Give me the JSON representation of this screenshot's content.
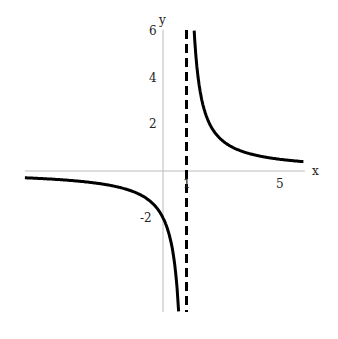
{
  "chart_data": {
    "type": "line",
    "title": "",
    "function": "y = 2/(x-1)",
    "xlabel": "x",
    "ylabel": "y",
    "xlim": [
      -5.9,
      6
    ],
    "ylim": [
      -6,
      6
    ],
    "x_ticks": [
      {
        "value": 1,
        "label": "1"
      },
      {
        "value": 5,
        "label": "5"
      }
    ],
    "y_ticks": [
      {
        "value": 6,
        "label": "6"
      },
      {
        "value": 4,
        "label": "4"
      },
      {
        "value": 2,
        "label": "2"
      },
      {
        "value": -2,
        "label": "-2"
      }
    ],
    "asymptotes": [
      {
        "type": "vertical",
        "x": 1,
        "style": "dashed"
      }
    ],
    "series": [
      {
        "name": "left branch",
        "x": [
          -5.9,
          -4,
          -2,
          -1,
          0,
          0.5,
          0.67
        ],
        "y": [
          -0.29,
          -0.4,
          -0.67,
          -1,
          -2,
          -4,
          -6
        ]
      },
      {
        "name": "right branch",
        "x": [
          1.33,
          1.5,
          2,
          3,
          4,
          5,
          6
        ],
        "y": [
          6,
          4,
          2,
          1,
          0.67,
          0.5,
          0.4
        ]
      }
    ],
    "grid": false,
    "legend": null
  },
  "labels": {
    "x_axis": "x",
    "y_axis": "y",
    "tick_x1": "1",
    "tick_x5": "5",
    "tick_y6": "6",
    "tick_y4": "4",
    "tick_y2": "2",
    "tick_yneg2": "-2"
  }
}
